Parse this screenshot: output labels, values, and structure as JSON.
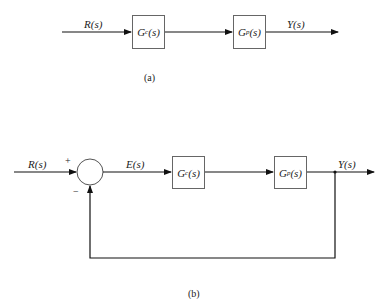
{
  "diagram_a": {
    "input_label": "R(s)",
    "output_label": "Y(s)",
    "blocks": [
      {
        "name": "G",
        "sub": "c",
        "arg": "(s)"
      },
      {
        "name": "G",
        "sub": "p",
        "arg": "(s)"
      }
    ],
    "caption": "(a)"
  },
  "diagram_b": {
    "input_label": "R(s)",
    "plus_sign": "+",
    "minus_sign": "−",
    "error_label": "E(s)",
    "output_label": "Y(s)",
    "blocks": [
      {
        "name": "G",
        "sub": "c",
        "arg": "(s)"
      },
      {
        "name": "G",
        "sub": "p",
        "arg": "(s)"
      }
    ],
    "caption": "(b)"
  }
}
